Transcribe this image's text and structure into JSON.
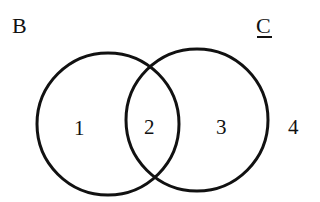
{
  "diagram": {
    "type": "venn",
    "sets": [
      {
        "name": "B",
        "underlined": false
      },
      {
        "name": "C",
        "underlined": true
      }
    ],
    "regions": [
      {
        "label": "1",
        "description": "B only"
      },
      {
        "label": "2",
        "description": "B and C"
      },
      {
        "label": "3",
        "description": "C only"
      },
      {
        "label": "4",
        "description": "outside B and C"
      }
    ],
    "stroke_color": "#111111"
  }
}
